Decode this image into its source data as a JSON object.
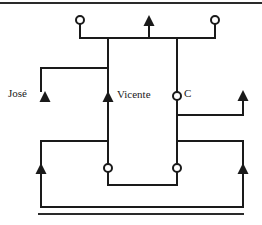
{
  "figure": {
    "background_color": "#ffffff",
    "stroke_color": "#1a1a1a",
    "labels": {
      "jose": "José",
      "vicente": "Vicente",
      "c": "C"
    },
    "rules": [
      {
        "name": "top-rule",
        "x1": 0,
        "y1": 3,
        "x2": 262,
        "y2": 3
      },
      {
        "name": "bottom-rule",
        "x1": 38,
        "y1": 214,
        "x2": 244,
        "y2": 214
      }
    ],
    "terminals": [
      {
        "name": "circle-top-left",
        "type": "circle",
        "cx": 80,
        "cy": 20,
        "r": 4
      },
      {
        "name": "circle-top-right",
        "type": "circle",
        "cx": 215,
        "cy": 20,
        "r": 4
      },
      {
        "name": "circle-node-c",
        "type": "circle",
        "cx": 177,
        "cy": 96,
        "r": 4
      },
      {
        "name": "circle-bottom-left",
        "type": "circle",
        "cx": 108,
        "cy": 168,
        "r": 4
      },
      {
        "name": "circle-bottom-right",
        "type": "circle",
        "cx": 177,
        "cy": 168,
        "r": 4
      },
      {
        "name": "arrow-top-center",
        "type": "arrow-up",
        "x": 149,
        "tip_y": 15
      },
      {
        "name": "arrow-jose",
        "type": "arrow-up",
        "x": 45,
        "tip_y": 91
      },
      {
        "name": "arrow-vicente",
        "type": "arrow-up",
        "x": 108,
        "tip_y": 91
      },
      {
        "name": "arrow-right-upper",
        "type": "arrow-up",
        "x": 243,
        "tip_y": 90
      },
      {
        "name": "arrow-left-lower",
        "type": "arrow-up",
        "x": 41,
        "tip_y": 163
      },
      {
        "name": "arrow-right-lower",
        "type": "arrow-up",
        "x": 243,
        "tip_y": 163
      }
    ],
    "wires": [
      {
        "name": "wire-top-bus",
        "points": "80,24 80,38 215,38 215,24"
      },
      {
        "name": "wire-top-center-stem",
        "points": "149,23 149,38"
      },
      {
        "name": "wire-left-column",
        "points": "108,38 108,164"
      },
      {
        "name": "wire-right-column",
        "points": "177,38 177,164"
      },
      {
        "name": "wire-jose-branch",
        "points": "41,91 41,68 108,68"
      },
      {
        "name": "wire-right-upper-branch",
        "points": "243,98 243,115 177,115"
      },
      {
        "name": "wire-left-lower-loop",
        "points": "108,141 41,141 41,207 243,207"
      },
      {
        "name": "wire-right-lower-loop",
        "points": "177,141 243,141 243,207"
      },
      {
        "name": "wire-bottom-bridge",
        "points": "108,172 108,185 177,185 177,172"
      }
    ]
  }
}
